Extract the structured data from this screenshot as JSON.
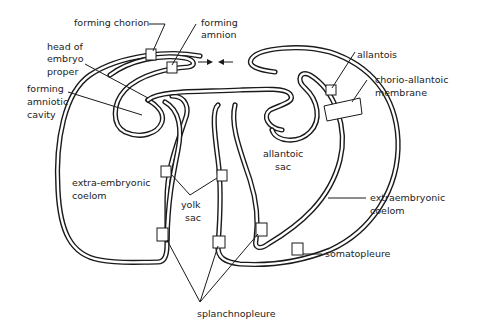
{
  "diagram": {
    "title": "",
    "labels": {
      "forming_chorion": "forming chorion",
      "forming_amnion": [
        "forming",
        "amnion"
      ],
      "head_of_embryo_proper": [
        "head of",
        "embryo",
        "proper"
      ],
      "forming_amniotic_cavity": [
        "forming",
        "amniotic",
        "cavity"
      ],
      "allantois": "allantois",
      "chorio_allantoic_membrane": [
        "chorio-allantoic",
        "membrane"
      ],
      "allantoic_sac": [
        "allantoic",
        "sac"
      ],
      "extra_embryonic_coelom_left": [
        "extra-embryonic",
        "coelom"
      ],
      "yolk_sac": [
        "yolk",
        "sac"
      ],
      "extraembryonic_coelom_right": [
        "extraembryonic",
        "coelom"
      ],
      "somatopleure": "somatopleure",
      "splanchnopleure": "splanchnopleure"
    },
    "colors": {
      "line": "#1a1a1a",
      "background": "#ffffff",
      "text": "#222222"
    }
  }
}
